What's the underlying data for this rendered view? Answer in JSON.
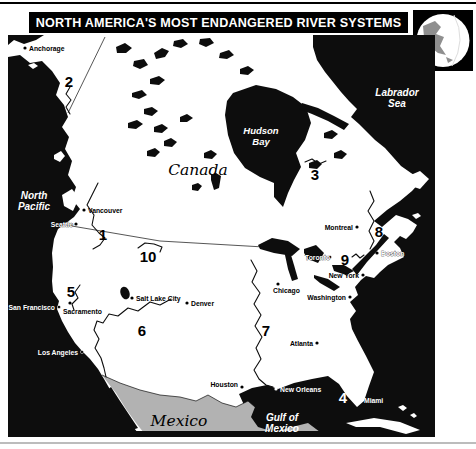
{
  "title": "NORTH AMERICA'S MOST ENDANGERED RIVER SYSTEMS",
  "colors": {
    "ocean": "#0d0d0d",
    "land": "#ffffff",
    "mexico_fill": "#b2b2b2",
    "bar_bg": "#000000",
    "bar_fg": "#ffffff",
    "globe_land": "#8f8f8f",
    "bottom_rule": "#bcbcbc"
  },
  "icons": {
    "corner": "globe-north-america"
  },
  "ocean_labels": {
    "north_pacific": [
      "North",
      "Pacific"
    ],
    "hudson_bay": [
      "Hudson",
      "Bay"
    ],
    "labrador_sea": [
      "Labrador",
      "Sea"
    ],
    "gulf_of_mexico": [
      "Gulf of",
      "Mexico"
    ]
  },
  "countries": {
    "canada": "Canada",
    "mexico": "Mexico"
  },
  "cities": [
    {
      "name": "Anchorage"
    },
    {
      "name": "Vancouver"
    },
    {
      "name": "Seattle"
    },
    {
      "name": "San Francisco"
    },
    {
      "name": "Sacramento"
    },
    {
      "name": "Los Angeles"
    },
    {
      "name": "Salt Lake City"
    },
    {
      "name": "Denver"
    },
    {
      "name": "Chicago"
    },
    {
      "name": "Houston"
    },
    {
      "name": "New Orleans"
    },
    {
      "name": "Atlanta"
    },
    {
      "name": "Miami"
    },
    {
      "name": "Washington"
    },
    {
      "name": "New York"
    },
    {
      "name": "Boston"
    },
    {
      "name": "Montreal"
    },
    {
      "name": "Toronto"
    }
  ],
  "numbers": [
    "1",
    "2",
    "3",
    "4",
    "5",
    "6",
    "7",
    "8",
    "9",
    "10"
  ]
}
